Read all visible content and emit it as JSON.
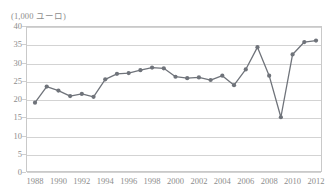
{
  "axis_unit_label": "(1,000  ユーロ)",
  "style": {
    "line_color": "#6f737a",
    "marker_color": "#6f737a",
    "grid_color": "#d3d3d3",
    "frame_color": "#c9c9c9",
    "text_color": "#8d8d8d"
  },
  "chart_data": {
    "type": "line",
    "title": "",
    "subtitle": "",
    "xlabel": "",
    "ylabel": "(1,000  ユーロ)",
    "ylim": [
      0,
      40
    ],
    "ytick_labels": [
      "40",
      "35",
      "30",
      "25",
      "20",
      "15",
      "10",
      "5",
      "0"
    ],
    "ytick_values": [
      40,
      35,
      30,
      25,
      20,
      15,
      10,
      5,
      0
    ],
    "grid": true,
    "legend": "none",
    "xtick_labels": [
      "1988",
      "1990",
      "1992",
      "1994",
      "1996",
      "1998",
      "2000",
      "2002",
      "2004",
      "2006",
      "2008",
      "2010",
      "2012"
    ],
    "xtick_values": [
      1988,
      1990,
      1992,
      1994,
      1996,
      1998,
      2000,
      2002,
      2004,
      2006,
      2008,
      2010,
      2012
    ],
    "x": [
      1988,
      1989,
      1990,
      1991,
      1992,
      1993,
      1994,
      1995,
      1996,
      1997,
      1998,
      1999,
      2000,
      2001,
      2002,
      2003,
      2004,
      2005,
      2006,
      2007,
      2008,
      2009,
      2010,
      2011,
      2012
    ],
    "values": [
      19.0,
      23.4,
      22.3,
      20.8,
      21.4,
      20.6,
      25.4,
      26.9,
      27.1,
      27.9,
      28.6,
      28.4,
      26.1,
      25.7,
      25.9,
      25.2,
      26.4,
      23.8,
      28.1,
      34.2,
      26.4,
      15.0,
      32.2,
      35.6,
      36.0
    ],
    "series": [
      {
        "name": "",
        "values": [
          19.0,
          23.4,
          22.3,
          20.8,
          21.4,
          20.6,
          25.4,
          26.9,
          27.1,
          27.9,
          28.6,
          28.4,
          26.1,
          25.7,
          25.9,
          25.2,
          26.4,
          23.8,
          28.1,
          34.2,
          26.4,
          15.0,
          32.2,
          35.6,
          36.0
        ]
      }
    ]
  }
}
